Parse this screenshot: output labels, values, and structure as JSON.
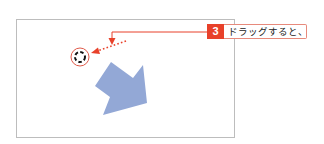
{
  "callout": {
    "step_number": "3",
    "text": "ドラッグすると、"
  },
  "icons": {
    "rotate_handle": "rotate-handle-icon",
    "shape": "blue-arrow-shape"
  },
  "colors": {
    "accent_red": "#e8412a",
    "callout_border": "#e78a7c",
    "shape_fill": "#93a8d6",
    "canvas_border": "#bdbdbd"
  }
}
